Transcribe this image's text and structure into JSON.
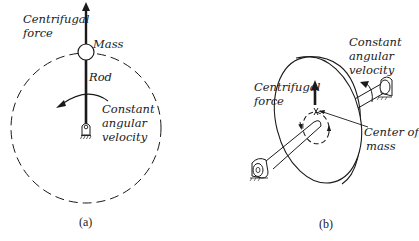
{
  "figure": {
    "panel_a": {
      "caption": "(a)",
      "labels": {
        "centrifugal_1": "Centrifugal",
        "centrifugal_2": "force",
        "mass": "Mass",
        "rod": "Rod",
        "velocity_1": "Constant",
        "velocity_2": "angular",
        "velocity_3": "velocity"
      }
    },
    "panel_b": {
      "caption": "(b)",
      "labels": {
        "velocity_1": "Constant",
        "velocity_2": "angular",
        "velocity_3": "velocity",
        "centrifugal_1": "Centrifugal",
        "centrifugal_2": "force",
        "center_1": "Center of",
        "center_2": "mass"
      }
    },
    "colors": {
      "ink": "#1a1a1a",
      "background": "#ffffff"
    }
  }
}
